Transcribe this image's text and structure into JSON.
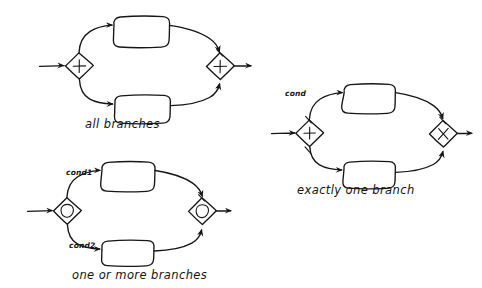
{
  "page": {
    "background_color": "#ffffff",
    "ink_color": "#161616"
  },
  "diagrams": [
    {
      "id": "all-branches",
      "caption": "all branches",
      "split_gateway": {
        "type": "parallel",
        "symbol": "plus",
        "glyph": "+"
      },
      "join_gateway": {
        "type": "parallel",
        "symbol": "plus",
        "glyph": "+"
      },
      "branches": [
        {
          "label": "",
          "task_label": ""
        },
        {
          "label": "",
          "task_label": ""
        }
      ]
    },
    {
      "id": "exactly-one-branch",
      "caption": "exactly one branch",
      "split_gateway": {
        "type": "exclusive",
        "symbol": "cross",
        "glyph": "×"
      },
      "join_gateway": {
        "type": "exclusive",
        "symbol": "cross",
        "glyph": "×"
      },
      "branches": [
        {
          "label": "cond",
          "task_label": ""
        },
        {
          "label": "",
          "task_label": ""
        }
      ]
    },
    {
      "id": "one-or-more-branches",
      "caption": "one or more branches",
      "split_gateway": {
        "type": "inclusive",
        "symbol": "circle",
        "glyph": "○"
      },
      "join_gateway": {
        "type": "inclusive",
        "symbol": "circle",
        "glyph": "○"
      },
      "branches": [
        {
          "label": "cond1",
          "task_label": ""
        },
        {
          "label": "cond2",
          "task_label": ""
        }
      ]
    }
  ]
}
